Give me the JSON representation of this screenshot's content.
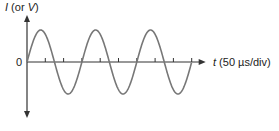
{
  "chart_data": {
    "type": "line",
    "title": "",
    "ylabel_var": "I",
    "ylabel_rest": " (or ",
    "ylabel_var2": "V",
    "ylabel_close": ")",
    "xlabel_var": "t",
    "xlabel_rest": " (50 µs/div)",
    "origin_label": "0",
    "x_divisions": 9,
    "div_us": 50,
    "period_divs": 3,
    "cycles": 3,
    "series": [
      {
        "name": "sine",
        "function": "sin",
        "amplitude": 1,
        "period_us": 150
      }
    ],
    "x": [
      0,
      50,
      100,
      150,
      200,
      250,
      300,
      350,
      400,
      450
    ],
    "values": [
      0,
      0.866,
      -0.866,
      0,
      0.866,
      -0.866,
      0,
      0.866,
      -0.866,
      0
    ],
    "grid": false,
    "legend": null
  },
  "colors": {
    "axis": "#333333",
    "curve": "#777777"
  }
}
